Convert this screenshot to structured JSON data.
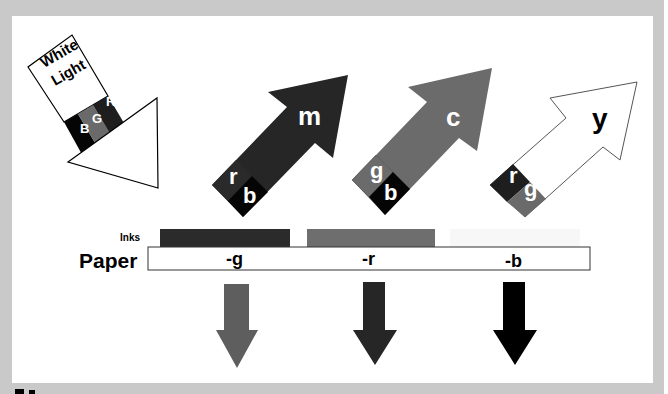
{
  "colors": {
    "frame": "#c9c9c9",
    "panel": "#ffffff",
    "magenta_ink": "#2b2b2b",
    "cyan_ink": "#6e6e6e",
    "yellow_ink": "#f7f7f7",
    "red_light": "#1e1e1e",
    "green_light": "#6a6a6a",
    "blue_light": "#050505",
    "arrow_m": "#262626",
    "arrow_c": "#6b6b6b",
    "arrow_y": "#ffffff",
    "out_g": "#5e5e5e",
    "out_r": "#262626",
    "out_b": "#000000"
  },
  "white_light": {
    "label_line1": "White",
    "label_line2": "Light",
    "bands": [
      "B",
      "G",
      "R"
    ]
  },
  "reflected_arrows": [
    {
      "name": "magenta",
      "label": "m",
      "components": [
        "r",
        "b"
      ]
    },
    {
      "name": "cyan",
      "label": "c",
      "components": [
        "g",
        "b"
      ]
    },
    {
      "name": "yellow",
      "label": "y",
      "components": [
        "r",
        "g"
      ]
    }
  ],
  "inks_label": "Inks",
  "paper": {
    "label": "Paper",
    "absorptions": [
      "-g",
      "-r",
      "-b"
    ]
  },
  "figure_number_fragment": "5.1"
}
